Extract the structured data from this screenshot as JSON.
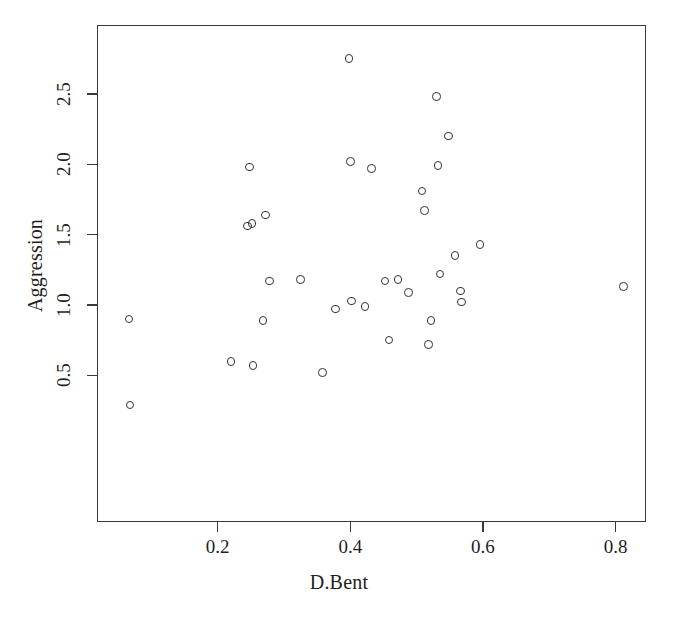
{
  "chart_data": {
    "type": "scatter",
    "title": "",
    "xlabel": "D.Bent",
    "ylabel": "Aggression",
    "xlim": [
      0.02,
      0.85
    ],
    "ylim": [
      0.2,
      2.83
    ],
    "xticks": [
      0.2,
      0.4,
      0.6,
      0.8
    ],
    "xticklabels": [
      "0.2",
      "0.4",
      "0.6",
      "0.8"
    ],
    "yticks": [
      0.5,
      1.0,
      1.5,
      2.0,
      2.5
    ],
    "yticklabels": [
      "0.5",
      "1.0",
      "1.5",
      "2.0",
      "2.5"
    ],
    "grid": false,
    "legend": null,
    "marker": "open-circle",
    "marker_color": "#33333a",
    "points": [
      {
        "x": 0.066,
        "y": 0.9
      },
      {
        "x": 0.068,
        "y": 0.29
      },
      {
        "x": 0.22,
        "y": 0.6
      },
      {
        "x": 0.248,
        "y": 1.98
      },
      {
        "x": 0.245,
        "y": 1.56
      },
      {
        "x": 0.252,
        "y": 1.58
      },
      {
        "x": 0.253,
        "y": 0.57
      },
      {
        "x": 0.272,
        "y": 1.64
      },
      {
        "x": 0.268,
        "y": 0.89
      },
      {
        "x": 0.278,
        "y": 1.17
      },
      {
        "x": 0.325,
        "y": 1.18
      },
      {
        "x": 0.358,
        "y": 0.52
      },
      {
        "x": 0.378,
        "y": 0.97
      },
      {
        "x": 0.398,
        "y": 2.75
      },
      {
        "x": 0.4,
        "y": 2.02
      },
      {
        "x": 0.402,
        "y": 1.03
      },
      {
        "x": 0.422,
        "y": 0.99
      },
      {
        "x": 0.432,
        "y": 1.97
      },
      {
        "x": 0.452,
        "y": 1.17
      },
      {
        "x": 0.458,
        "y": 0.75
      },
      {
        "x": 0.472,
        "y": 1.18
      },
      {
        "x": 0.488,
        "y": 1.09
      },
      {
        "x": 0.508,
        "y": 1.81
      },
      {
        "x": 0.512,
        "y": 1.67
      },
      {
        "x": 0.518,
        "y": 0.72
      },
      {
        "x": 0.522,
        "y": 0.89
      },
      {
        "x": 0.53,
        "y": 2.48
      },
      {
        "x": 0.532,
        "y": 1.99
      },
      {
        "x": 0.535,
        "y": 1.22
      },
      {
        "x": 0.548,
        "y": 2.2
      },
      {
        "x": 0.558,
        "y": 1.35
      },
      {
        "x": 0.566,
        "y": 1.1
      },
      {
        "x": 0.568,
        "y": 1.02
      },
      {
        "x": 0.596,
        "y": 1.43
      },
      {
        "x": 0.812,
        "y": 1.13
      }
    ]
  }
}
